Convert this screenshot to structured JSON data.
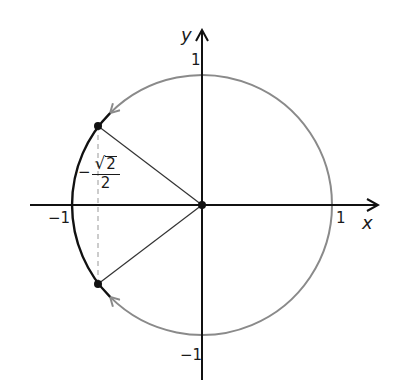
{
  "diagram": {
    "type": "unit-circle",
    "origin_px": [
      202,
      205
    ],
    "radius_px": 130,
    "axes": {
      "x": {
        "name": "x",
        "tick_pos": "1",
        "tick_neg": "−1"
      },
      "y": {
        "name": "y",
        "tick_pos": "1",
        "tick_neg": "−1"
      }
    },
    "points": [
      {
        "angle_deg": 135,
        "label": "upper-left point"
      },
      {
        "angle_deg": 225,
        "label": "lower-left point"
      }
    ],
    "annotation": {
      "minus": "−",
      "radical": "√",
      "radicand": "2",
      "denominator": "2",
      "meaning": "x = −√2/2"
    },
    "colors": {
      "axis": "#111111",
      "highlighted_arc": "#111111",
      "traced_arc": "#8a8a8a",
      "radius_line": "#333333",
      "dashed_line": "#999999"
    }
  }
}
